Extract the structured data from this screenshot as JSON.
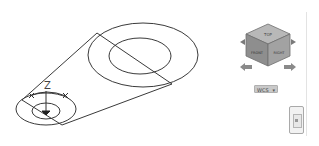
{
  "viewport": {
    "background": "#ffffff",
    "line_color": "#3a3a3a"
  },
  "drawing": {
    "large_outer_ellipse": {
      "cx": 143,
      "cy": 55,
      "rx": 55,
      "ry": 32
    },
    "large_inner_ellipse": {
      "cx": 140,
      "cy": 56,
      "rx": 31,
      "ry": 18
    },
    "small_outer_ellipse": {
      "cx": 46,
      "cy": 109,
      "rx": 30,
      "ry": 16
    },
    "small_inner_ellipse": {
      "cx": 46,
      "cy": 111,
      "rx": 14,
      "ry": 8
    },
    "tangent_lines": [
      {
        "x1": 22,
        "y1": 100,
        "x2": 97,
        "y2": 33
      },
      {
        "x1": 62,
        "y1": 125,
        "x2": 172,
        "y2": 84
      }
    ],
    "diagonal_lines": [
      {
        "x1": 97,
        "y1": 33,
        "x2": 172,
        "y2": 84
      },
      {
        "x1": 22,
        "y1": 100,
        "x2": 62,
        "y2": 125
      }
    ]
  },
  "ucs_icon": {
    "z_label": "Z",
    "origin": {
      "x": 46,
      "y": 112
    },
    "x_marker": "×",
    "y_marker": "×"
  },
  "viewcube": {
    "faces": {
      "top": "TOP",
      "front": "FRONT",
      "right": "RIGHT"
    },
    "face_color": "#9a9a9a"
  },
  "compass": {
    "left_arrow": "rotate-left-arrow",
    "right_arrow": "rotate-right-arrow"
  },
  "wcs_menu": {
    "label": "WCS",
    "arrow": "▾"
  },
  "navigation_bar": {
    "label": "navigation-bar"
  }
}
